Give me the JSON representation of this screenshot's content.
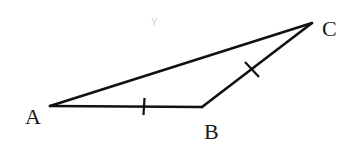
{
  "diagram": {
    "type": "triangle",
    "stroke_color": "#111111",
    "background": "#ffffff",
    "vertices": {
      "A": {
        "label": "A",
        "x": 50,
        "y": 106
      },
      "B": {
        "label": "B",
        "x": 202,
        "y": 107
      },
      "C": {
        "label": "C",
        "x": 312,
        "y": 23
      }
    },
    "sides": [
      {
        "name": "AB",
        "from": "A",
        "to": "B",
        "tick_marks": 1
      },
      {
        "name": "BC",
        "from": "B",
        "to": "C",
        "tick_marks": 1
      },
      {
        "name": "AC",
        "from": "A",
        "to": "C",
        "tick_marks": 0
      }
    ],
    "equal_sides_note": "AB = BC (single tick marks)",
    "labels": {
      "a": "A",
      "b": "B",
      "c": "C"
    },
    "faint_mark": "Y"
  }
}
